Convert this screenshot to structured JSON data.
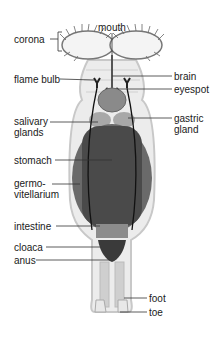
{
  "diagram": {
    "labels": {
      "corona": "corona",
      "mouth": "mouth",
      "flame_bulb": "flame bulb",
      "brain": "brain",
      "eyespot": "eyespot",
      "salivary_glands_1": "salivary",
      "salivary_glands_2": "glands",
      "gastric_gland_1": "gastric",
      "gastric_gland_2": "gland",
      "stomach": "stomach",
      "germovitellarium_1": "germo-",
      "germovitellarium_2": "vitellarium",
      "intestine": "intestine",
      "cloaca": "cloaca",
      "anus": "anus",
      "foot": "foot",
      "toe": "toe"
    },
    "colors": {
      "background": "#ffffff",
      "text": "#1a1a1a",
      "leader_line": "#333333",
      "body_outline": "#c8c8c8",
      "body_fill": "#ececec",
      "stomach": "#4a4a4a",
      "germovitellarium": "#6a6a6a"
    }
  }
}
